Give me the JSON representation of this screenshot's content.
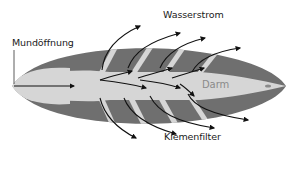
{
  "diagram": {
    "type": "anatomical-flow-diagram",
    "labels": {
      "mouth": "Mundöffnung",
      "water_current": "Wasserstrom",
      "gut": "Darm",
      "gill_filter": "Kiemenfilter"
    },
    "colors": {
      "body_dark": "#6f6f6f",
      "body_light": "#d6d6d6",
      "arrow": "#111111",
      "background": "#ffffff",
      "label_text": "#1a1a1a",
      "gut_label_text": "#8a8a8a"
    },
    "arrows": {
      "inflow": 1,
      "internal": 6,
      "outflow_up": 4,
      "outflow_down": 4
    }
  }
}
